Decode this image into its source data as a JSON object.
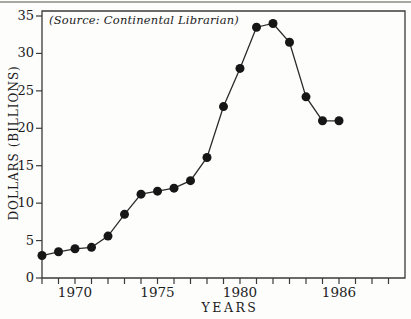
{
  "page": {
    "background_color": "#fdfdfc",
    "ink_color": "#1c1c1c"
  },
  "chart_data": {
    "type": "line",
    "source_note": "(Source: Continental Librarian)",
    "xlabel": "YEARS",
    "ylabel": "DOLLARS (BILLIONS)",
    "x": [
      1968,
      1969,
      1970,
      1971,
      1972,
      1973,
      1974,
      1975,
      1976,
      1977,
      1978,
      1979,
      1980,
      1981,
      1982,
      1983,
      1984,
      1985,
      1986
    ],
    "values": [
      3.0,
      3.5,
      3.9,
      4.1,
      5.6,
      8.5,
      11.2,
      11.6,
      12.0,
      13.0,
      16.1,
      22.9,
      28.0,
      33.5,
      34.0,
      31.5,
      24.2,
      21.0,
      21.0
    ],
    "xlim": [
      1968,
      1990
    ],
    "ylim": [
      0,
      35
    ],
    "yticks": [
      0,
      5,
      10,
      15,
      20,
      25,
      30,
      35
    ],
    "xticks_minor": [
      1968,
      1969,
      1970,
      1971,
      1972,
      1973,
      1974,
      1975,
      1976,
      1977,
      1978,
      1979,
      1980,
      1981,
      1982,
      1983,
      1984,
      1985,
      1986,
      1987,
      1988,
      1989
    ],
    "xtick_labels": [
      "1970",
      "1975",
      "1980",
      "1986"
    ],
    "xtick_label_years": [
      1970,
      1975,
      1980,
      1986
    ],
    "grid": false,
    "legend": "none",
    "marker": "filled-circle",
    "frame": "full-box",
    "line_color": "#2b2b2b",
    "marker_color": "#161616",
    "frame_color": "#3b3b3b"
  }
}
